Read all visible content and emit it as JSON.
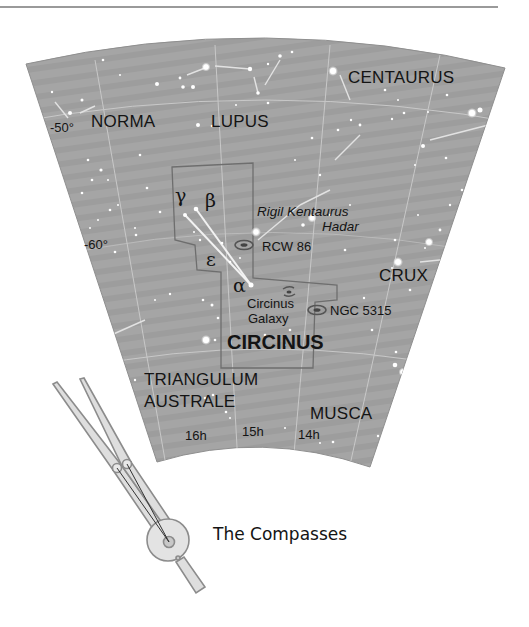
{
  "map": {
    "background_color": "#a3a3a3",
    "constellations": {
      "centaurus": "CENTAURUS",
      "norma": "NORMA",
      "lupus": "LUPUS",
      "crux": "CRUX",
      "circinus": "CIRCINUS",
      "triangulum_australe_line1": "TRIANGULUM",
      "triangulum_australe_line2": "AUSTRALE",
      "musca": "MUSCA"
    },
    "declinations": [
      "-50°",
      "-60°"
    ],
    "right_ascensions": [
      "16h",
      "15h",
      "14h"
    ],
    "stars": {
      "gamma": "γ",
      "beta": "β",
      "epsilon": "ε",
      "alpha": "α",
      "rigil_kentaurus": "Rigil Kentaurus",
      "hadar": "Hadar"
    },
    "deep_sky_objects": {
      "rcw86": "RCW 86",
      "circinus_galaxy_line1": "Circinus",
      "circinus_galaxy_line2": "Galaxy",
      "ngc5315": "NGC 5315"
    }
  },
  "figure": {
    "caption": "The Compasses",
    "icon": "compasses-icon"
  }
}
